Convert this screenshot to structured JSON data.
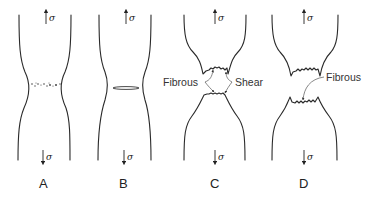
{
  "diagram": {
    "stress_symbol": "σ",
    "specimens": [
      {
        "id": "A",
        "label": "A",
        "stage": "necking with microvoid formation"
      },
      {
        "id": "B",
        "label": "B",
        "stage": "microvoid coalescence into crack"
      },
      {
        "id": "C",
        "label": "C",
        "stage": "crack propagation; fibrous centre and shear lip"
      },
      {
        "id": "D",
        "label": "D",
        "stage": "final cup-and-cone separation"
      }
    ],
    "callouts": {
      "c_fibrous": "Fibrous",
      "c_shear": "Shear",
      "d_fibrous": "Fibrous"
    }
  }
}
